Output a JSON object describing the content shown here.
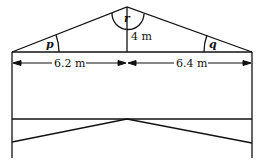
{
  "diagram": {
    "type": "house cross-section with roof truss",
    "labels": {
      "angle_left": "p",
      "angle_right": "q",
      "angle_apex": "r",
      "height": "4 m",
      "left_span": "6.2 m",
      "right_span": "6.4 m"
    },
    "colors": {
      "stroke": "#111111",
      "background": "#ffffff"
    }
  }
}
